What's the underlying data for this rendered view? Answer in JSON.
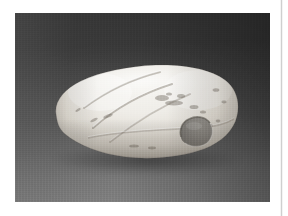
{
  "page": {
    "kind": "scanned-plate",
    "background_color": "#ffffff",
    "width": 288,
    "height": 216
  },
  "column_rule": {
    "name": "page-column-divider",
    "color": "#cfcfcf",
    "x": 281,
    "orientation": "vertical"
  },
  "photograph": {
    "caption": "",
    "subject": "stone artifact",
    "frame": {
      "left": 15,
      "top": 13,
      "width": 255,
      "height": 189
    },
    "backdrop": {
      "description": "graduated studio backdrop, dark charcoal at top, lighter gray toward the bottom",
      "top_color": "#383838",
      "bottom_color": "#7d7d7d",
      "right_shadow_color": "#2e2e2e"
    },
    "object": {
      "name": "perforated stone artifact",
      "shape": "elongated ovoid / loaf-shaped cobble",
      "orientation": "horizontal, tapering to the left",
      "material_appearance": "white to cream polished stone",
      "highlight_color": "#f4f2ee",
      "midtone_color": "#ddd9d2",
      "shadow_color": "#a9a49c",
      "features": [
        "three diagonal incised grooves across the upper left half",
        "single drilled perforation on the lower right face",
        "scattered dark mineral inclusions and surface pitting",
        "worn rounded edges with a broad reflective highlight along the top"
      ],
      "perforation": {
        "name": "drilled-hole",
        "center_x": 175,
        "center_y": 135,
        "interior_color": "#8d8a85"
      }
    }
  }
}
